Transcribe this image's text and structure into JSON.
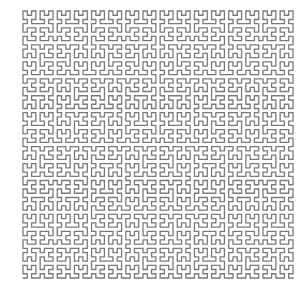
{
  "figure": {
    "order": 6,
    "stroke_color": "#7a7a7a",
    "background_color": "#ffffff",
    "stroke_width": 1.3,
    "bounds": {
      "x0": 23,
      "y0": 11,
      "x1": 293,
      "y1": 278
    }
  }
}
